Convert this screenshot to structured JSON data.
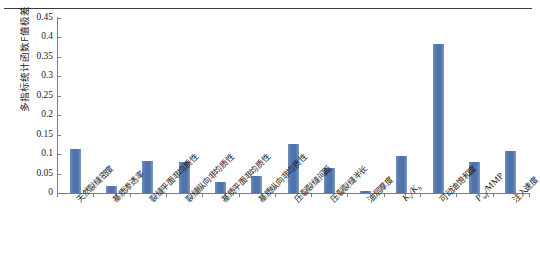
{
  "chart_data": {
    "type": "bar",
    "title": "",
    "xlabel": "",
    "ylabel": "多指标统计函数F值极差",
    "ylim": [
      0,
      0.45
    ],
    "yticks": [
      "0",
      "0.05",
      "0.1",
      "0.15",
      "0.2",
      "0.25",
      "0.3",
      "0.35",
      "0.4",
      "0.45"
    ],
    "ytick_values": [
      0,
      0.05,
      0.1,
      0.15,
      0.2,
      0.25,
      0.3,
      0.35,
      0.4,
      0.45
    ],
    "grid": false,
    "legend": "none",
    "bar_color": "#5378ae",
    "categories": [
      "天然裂缝密度",
      "基质渗透率",
      "裂缝平面非均质性",
      "裂缝纵向非均质性",
      "基质平面非均质性",
      "基质纵向非均质性",
      "压裂裂缝间距",
      "压裂裂缝半长",
      "油层厚度",
      "Kv/Kh",
      "可动油饱和度",
      "Pwf/MMP",
      "注入速度"
    ],
    "categories_display": [
      {
        "text": "天然裂缝密度",
        "math": false
      },
      {
        "text": "基质渗透率",
        "math": false
      },
      {
        "text": "裂缝平面非均质性",
        "math": false
      },
      {
        "text": "裂缝纵向非均质性",
        "math": false
      },
      {
        "text": "基质平面非均质性",
        "math": false
      },
      {
        "text": "基质纵向非均质性",
        "math": false
      },
      {
        "text": "压裂裂缝间距",
        "math": false
      },
      {
        "text": "压裂裂缝半长",
        "math": false
      },
      {
        "text": "油层厚度",
        "math": false
      },
      {
        "text": "Kv/Kh",
        "math": true
      },
      {
        "text": "可动油饱和度",
        "math": false
      },
      {
        "text": "Pwf/MMP",
        "math": true
      },
      {
        "text": "注入速度",
        "math": false
      }
    ],
    "values": [
      0.112,
      0.018,
      0.082,
      0.079,
      0.028,
      0.043,
      0.127,
      0.065,
      0.005,
      0.096,
      0.384,
      0.081,
      0.108
    ]
  },
  "figure": {
    "top_rule": true
  }
}
